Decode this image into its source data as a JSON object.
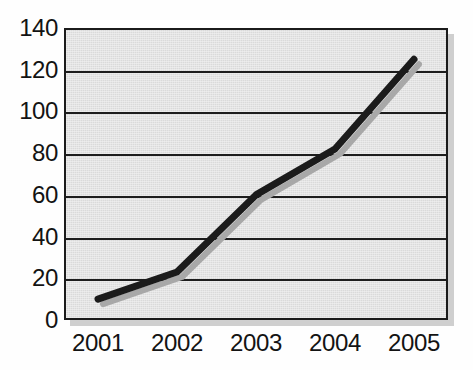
{
  "chart_data": {
    "type": "line",
    "title": "",
    "subtitle": "",
    "xlabel": "",
    "ylabel": "",
    "categories": [
      "2001",
      "2002",
      "2003",
      "2004",
      "2005"
    ],
    "x": [
      2001,
      2002,
      2003,
      2004,
      2005
    ],
    "series": [
      {
        "name": "series-1",
        "values": [
          10,
          23,
          60,
          82,
          125
        ],
        "color": "#1b1b1b",
        "line_width": 7,
        "has_drop_shadow": true,
        "shadow_color": "#a8a8a8"
      }
    ],
    "values": [
      10,
      23,
      60,
      82,
      125
    ],
    "ylim": [
      0,
      140
    ],
    "ytick_values": [
      0,
      20,
      40,
      60,
      80,
      100,
      120,
      140
    ],
    "ytick_labels": [
      "0",
      "20",
      "40",
      "60",
      "80",
      "100",
      "120",
      "140"
    ],
    "xtick_labels": [
      "2001",
      "2002",
      "2003",
      "2004",
      "2005"
    ],
    "grid": {
      "horizontal": true,
      "vertical": false,
      "color": "#1d1d1d"
    },
    "legend": {
      "visible": false,
      "position": "none",
      "entries": []
    },
    "plot_background_color": "#e2e2e2",
    "figure_background_color": "#fefefe",
    "frame_color": "#1b1b1b",
    "frame_drop_shadow_color": "#cfcfcf",
    "annotations": []
  },
  "axes": {
    "y_ticks": [
      {
        "label": "140",
        "value": 140
      },
      {
        "label": "120",
        "value": 120
      },
      {
        "label": "100",
        "value": 100
      },
      {
        "label": "80",
        "value": 80
      },
      {
        "label": "60",
        "value": 60
      },
      {
        "label": "40",
        "value": 40
      },
      {
        "label": "20",
        "value": 20
      },
      {
        "label": "0",
        "value": 0
      }
    ],
    "x_ticks": [
      {
        "label": "2001"
      },
      {
        "label": "2002"
      },
      {
        "label": "2003"
      },
      {
        "label": "2004"
      },
      {
        "label": "2005"
      }
    ]
  }
}
